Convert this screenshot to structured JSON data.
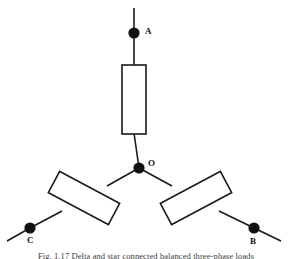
{
  "figure": {
    "caption_label": "Fig. 1.17",
    "caption_text": "Delta and star connected balanced three-phase loads",
    "caption_full": "Fig. 1.17   Delta and star connected balanced three-phase loads"
  },
  "diagram": {
    "background_color": "#ffffff",
    "line_color": "#1a1a1a",
    "node_color": "#111111",
    "nodes": [
      {
        "id": "A",
        "label": "A",
        "x": 134,
        "y": 33,
        "radius": 5.6
      },
      {
        "id": "O",
        "label": "O",
        "x": 139,
        "y": 168,
        "radius": 5.6
      },
      {
        "id": "C",
        "label": "C",
        "x": 30,
        "y": 228,
        "radius": 5.6
      },
      {
        "id": "B",
        "label": "B",
        "x": 254,
        "y": 228,
        "radius": 5.6
      }
    ],
    "components": [
      {
        "id": "resistor-a",
        "type": "resistor",
        "branch": "O-A",
        "center_x": 134,
        "center_y": 99,
        "width": 24,
        "height": 69,
        "rotation_deg": 0
      },
      {
        "id": "resistor-c",
        "type": "resistor",
        "branch": "O-C",
        "center_x": 84,
        "center_y": 198,
        "width": 68,
        "height": 24,
        "rotation_deg": 28
      },
      {
        "id": "resistor-b",
        "type": "resistor",
        "branch": "O-B",
        "center_x": 196,
        "center_y": 198,
        "width": 68,
        "height": 24,
        "rotation_deg": -28
      }
    ],
    "wires": [
      {
        "id": "wire-a-terminal",
        "from": [
          134,
          8
        ],
        "to": [
          134,
          33
        ]
      },
      {
        "id": "wire-a-resistor",
        "from": [
          134,
          33
        ],
        "to": [
          134,
          65
        ]
      },
      {
        "id": "wire-a-node",
        "from": [
          134,
          134
        ],
        "to": [
          139,
          168
        ]
      },
      {
        "id": "wire-o-c",
        "from": [
          139,
          168
        ],
        "to": [
          30,
          228
        ]
      },
      {
        "id": "wire-c-terminal",
        "from": [
          30,
          228
        ],
        "to": [
          7,
          241
        ]
      },
      {
        "id": "wire-o-b",
        "from": [
          139,
          168
        ],
        "to": [
          254,
          228
        ]
      },
      {
        "id": "wire-b-terminal",
        "from": [
          254,
          228
        ],
        "to": [
          281,
          241
        ]
      }
    ]
  }
}
